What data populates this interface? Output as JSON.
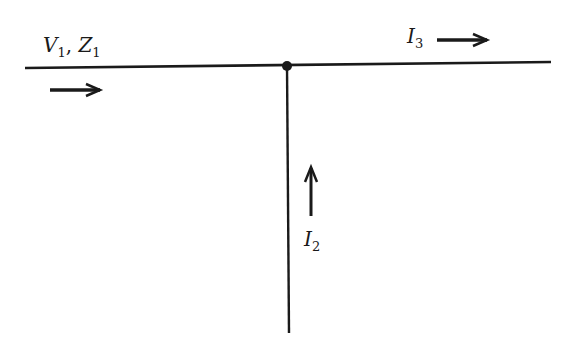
{
  "diagram": {
    "type": "transmission-line-junction",
    "colors": {
      "line": "#1a1a1a",
      "background": "#ffffff"
    },
    "lines": {
      "main_line": {
        "label_main": "V",
        "label_sub": "1",
        "sep": ", ",
        "label2_main": "Z",
        "label2_sub": "1"
      },
      "branch_line": {}
    },
    "currents": [
      {
        "id": "I3",
        "main": "I",
        "sub": "3",
        "direction": "right"
      },
      {
        "id": "I2",
        "main": "I",
        "sub": "2",
        "direction": "up"
      },
      {
        "id": "incident",
        "direction": "right"
      }
    ]
  }
}
